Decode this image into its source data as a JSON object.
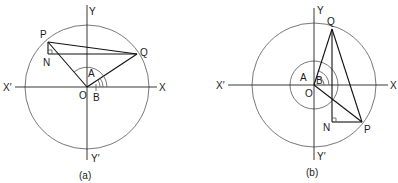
{
  "figures": [
    {
      "id": "a",
      "caption": "(a)",
      "labels": {
        "P": "P",
        "Q": "Q",
        "N": "N",
        "O": "O",
        "A": "A",
        "B": "B",
        "X": "X",
        "Xp": "X′",
        "Y": "Y",
        "Yp": "Y′"
      }
    },
    {
      "id": "b",
      "caption": "(b)",
      "labels": {
        "P": "P",
        "Q": "Q",
        "N": "N",
        "O": "O",
        "A": "A",
        "B": "B",
        "X": "X",
        "Xp": "X′",
        "Y": "Y",
        "Yp": "Y′"
      }
    }
  ]
}
